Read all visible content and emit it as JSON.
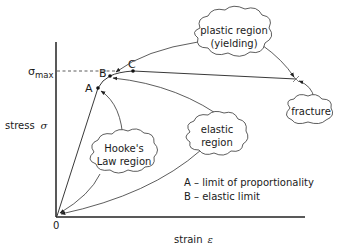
{
  "diagram": {
    "axes": {
      "y_label": "stress",
      "y_symbol": "σ",
      "x_label": "strain",
      "x_symbol": "ε",
      "origin_label": "0",
      "sigma_max_symbol": "σ",
      "sigma_max_subscript": "max"
    },
    "points": [
      {
        "id": "A",
        "label": "A"
      },
      {
        "id": "B",
        "label": "B"
      },
      {
        "id": "C",
        "label": "C"
      }
    ],
    "clouds": {
      "plastic": {
        "line1": "plastic region",
        "line2": "(yielding)"
      },
      "fracture": {
        "line1": "fracture"
      },
      "hookes": {
        "line1": "Hooke's",
        "line2": "Law region"
      },
      "elastic": {
        "line1": "elastic",
        "line2": "region"
      }
    },
    "legend": [
      {
        "text": "A – limit of proportionality"
      },
      {
        "text": "B – elastic limit"
      }
    ],
    "colors": {
      "line": "#222222",
      "background": "#ffffff"
    }
  }
}
